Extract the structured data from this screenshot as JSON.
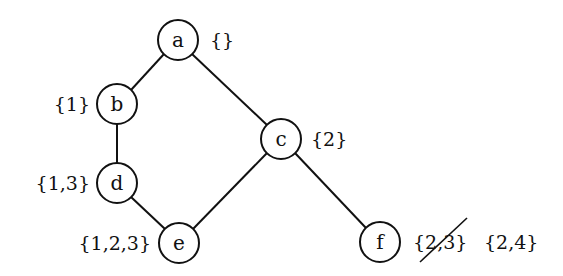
{
  "diagram": {
    "type": "tree",
    "nodes": [
      {
        "id": "a",
        "label": "a",
        "set": "{}",
        "x": 178,
        "y": 40
      },
      {
        "id": "b",
        "label": "b",
        "set": "{1}",
        "x": 117,
        "y": 104
      },
      {
        "id": "c",
        "label": "c",
        "set": "{2}",
        "x": 281,
        "y": 139
      },
      {
        "id": "d",
        "label": "d",
        "set": "{1,3}",
        "x": 117,
        "y": 183
      },
      {
        "id": "e",
        "label": "e",
        "set": "{1,2,3}",
        "x": 179,
        "y": 243
      },
      {
        "id": "f",
        "label": "f",
        "set_old": "{2,3}",
        "set": "{2,4}",
        "x": 380,
        "y": 242
      }
    ],
    "edges": [
      {
        "from": "a",
        "to": "b"
      },
      {
        "from": "a",
        "to": "c"
      },
      {
        "from": "b",
        "to": "d"
      },
      {
        "from": "d",
        "to": "e"
      },
      {
        "from": "c",
        "to": "e"
      },
      {
        "from": "c",
        "to": "f"
      }
    ],
    "annotations": {
      "f_crossed_out": "{2,3}",
      "f_replacement": "{2,4}"
    }
  }
}
